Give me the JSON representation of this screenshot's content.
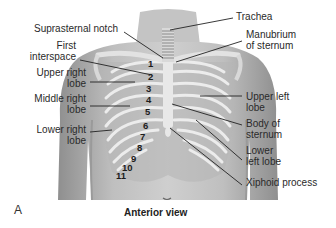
{
  "figure": {
    "panel_letter": "A",
    "caption": "Anterior view",
    "labels_left": [
      {
        "id": "suprasternal-notch",
        "text": "Suprasternal notch"
      },
      {
        "id": "first-interspace",
        "text": "First\ninterspace"
      },
      {
        "id": "upper-right-lobe",
        "text": "Upper right\nlobe"
      },
      {
        "id": "middle-right-lobe",
        "text": "Middle right\nlobe"
      },
      {
        "id": "lower-right-lobe",
        "text": "Lower right\nlobe"
      }
    ],
    "labels_right": [
      {
        "id": "trachea",
        "text": "Trachea"
      },
      {
        "id": "manubrium-of-sternum",
        "text": "Manubrium\nof sternum"
      },
      {
        "id": "upper-left-lobe",
        "text": "Upper left\nlobe"
      },
      {
        "id": "body-of-sternum",
        "text": "Body of\nsternum"
      },
      {
        "id": "lower-left-lobe",
        "text": "Lower\nleft lobe"
      },
      {
        "id": "xiphoid-process",
        "text": "Xiphoid process"
      }
    ],
    "rib_numbers": [
      "1",
      "2",
      "3",
      "4",
      "5",
      "6",
      "7",
      "8",
      "9",
      "10",
      "11"
    ],
    "colors": {
      "skin": "#bdbdbd",
      "skin_shadow": "#8f8f8f",
      "bone": "#e6e6e6",
      "leader_line": "#222222"
    }
  }
}
